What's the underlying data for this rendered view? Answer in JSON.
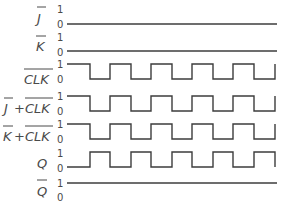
{
  "colors": {
    "waveform": "#3c3c3c",
    "text": "#4a4a4a",
    "background": "#ffffff"
  },
  "time": {
    "x_start": 67,
    "x_end": 277,
    "half_period_px": 20.6
  },
  "signals": [
    {
      "id": "j_bar",
      "label": "J",
      "label_suffix": "",
      "overbar": "J",
      "level_high": "1",
      "level_low": "0",
      "waveform": "constant-low",
      "edges": []
    },
    {
      "id": "k_bar",
      "label": "K",
      "label_suffix": "",
      "overbar": "K",
      "level_high": "1",
      "level_low": "0",
      "waveform": "constant-low",
      "edges": []
    },
    {
      "id": "clk_bar",
      "label": "CLK",
      "label_suffix": "",
      "overbar": "CLK",
      "level_high": "1",
      "level_low": "0",
      "waveform": "clock",
      "initial": 1,
      "edges": [
        90,
        110,
        131,
        151,
        172,
        192,
        213,
        233,
        254,
        275
      ]
    },
    {
      "id": "j_bar_plus_clk_bar",
      "label": "J+CLK",
      "overbar": "J and CLK",
      "level_high": "1",
      "level_low": "0",
      "waveform": "clock",
      "initial": 1,
      "edges": [
        90,
        110,
        131,
        151,
        172,
        192,
        213,
        233,
        254,
        275
      ]
    },
    {
      "id": "k_bar_plus_clk_bar",
      "label": "K+CLK",
      "overbar": "K and CLK",
      "level_high": "1",
      "level_low": "0",
      "waveform": "clock",
      "initial": 1,
      "edges": [
        90,
        110,
        131,
        151,
        172,
        192,
        213,
        233,
        254,
        275
      ]
    },
    {
      "id": "q",
      "label": "Q",
      "overbar": "",
      "level_high": "1",
      "level_low": "0",
      "waveform": "toggle",
      "initial": 0,
      "edges": [
        90,
        110,
        131,
        151,
        172,
        192,
        213,
        233,
        254,
        275
      ]
    },
    {
      "id": "q_bar",
      "label": "Q",
      "overbar": "Q",
      "level_high": "1",
      "level_low": "0",
      "waveform": "constant-high",
      "edges": []
    }
  ],
  "text": {
    "j": "J",
    "k": "K",
    "clk": "CLK",
    "plus": "+",
    "q": "Q",
    "one": "1",
    "zero": "0"
  }
}
